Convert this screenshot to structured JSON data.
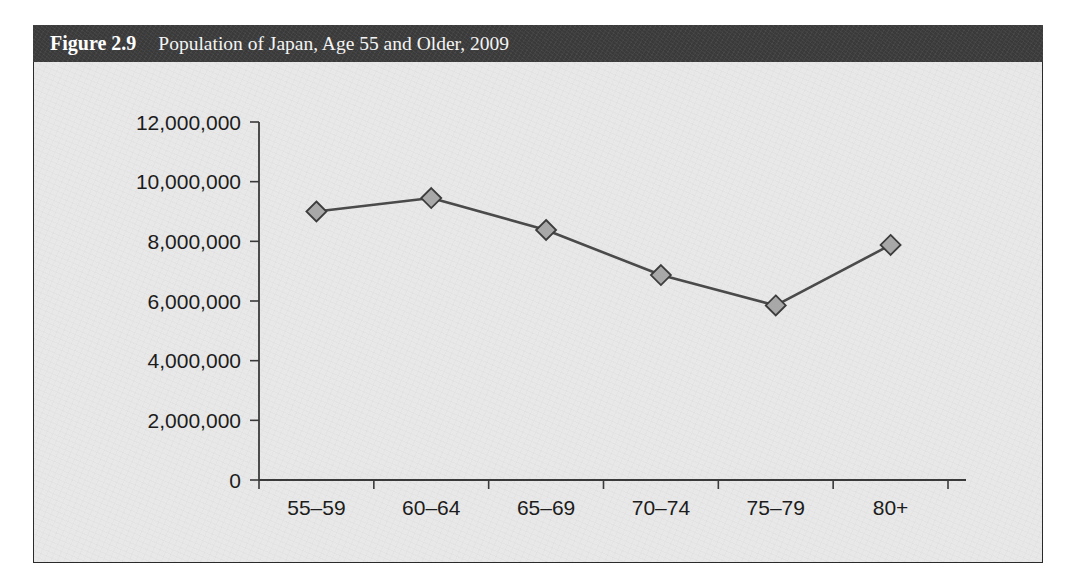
{
  "figure": {
    "label": "Figure 2.9",
    "title": "Population of Japan, Age 55 and Older, 2009"
  },
  "colors": {
    "banner_background": "#3a3a3a",
    "panel_background": "#e8e8e8",
    "frame_border": "#2a2a2a",
    "line": "#4a4a4a",
    "marker_fill": "#a8a8a8",
    "marker_stroke": "#3c3c3c",
    "axis": "#3a3a3a",
    "tick_text": "#1c1c1c"
  },
  "chart_data": {
    "type": "line",
    "title": "Population of Japan, Age 55 and Older, 2009",
    "xlabel": "",
    "ylabel": "",
    "categories": [
      "55–59",
      "60–64",
      "65–69",
      "70–74",
      "75–79",
      "80+"
    ],
    "values": [
      9000000,
      9450000,
      8380000,
      6870000,
      5850000,
      7880000
    ],
    "ylim": [
      0,
      12000000
    ],
    "yticks": [
      0,
      2000000,
      4000000,
      6000000,
      8000000,
      10000000,
      12000000
    ],
    "ytick_labels": [
      "0",
      "2,000,000",
      "4,000,000",
      "6,000,000",
      "8,000,000",
      "10,000,000",
      "12,000,000"
    ],
    "grid": false,
    "legend": false,
    "marker": "diamond",
    "series": [
      {
        "name": "Population",
        "values": [
          9000000,
          9450000,
          8380000,
          6870000,
          5850000,
          7880000
        ]
      }
    ]
  }
}
